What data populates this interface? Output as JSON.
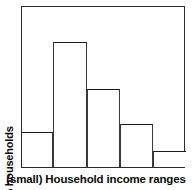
{
  "chart_data": {
    "type": "bar",
    "title": "",
    "subtitle": "",
    "xlabel": "(small) Household income ranges",
    "ylabel": "% households",
    "categories": [
      "1",
      "2",
      "3",
      "4",
      "5"
    ],
    "values": [
      22,
      78,
      49,
      27,
      10
    ],
    "bar_widths": [
      31,
      34,
      33,
      33,
      33
    ],
    "ylim": [
      0,
      100
    ],
    "xlim": [
      0,
      164
    ],
    "grid": false,
    "legend": null,
    "legend_position": "none",
    "tick_labels_x": [],
    "tick_labels_y": [],
    "annotations": [],
    "style": {
      "bar_fill": "#ffffff",
      "bar_edge": "#1a1a1a",
      "frame_color": "#2b2b2b",
      "background": "#ffffff",
      "text_color": "#0a0a0a"
    }
  },
  "figure": {
    "xlabel": "(small) Household income ranges",
    "ylabel": "% households"
  }
}
